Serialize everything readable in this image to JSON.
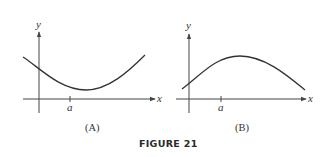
{
  "figure": {
    "caption": "FIGURE 21",
    "panels": [
      {
        "id": "A",
        "label": "(A)",
        "x_axis_label": "x",
        "y_axis_label": "y",
        "tick_label": "a",
        "curve_shape": "concave up (convex), minimum to the right of a"
      },
      {
        "id": "B",
        "label": "(B)",
        "x_axis_label": "x",
        "y_axis_label": "y",
        "tick_label": "a",
        "curve_shape": "concave down, maximum to the right of a"
      }
    ]
  }
}
